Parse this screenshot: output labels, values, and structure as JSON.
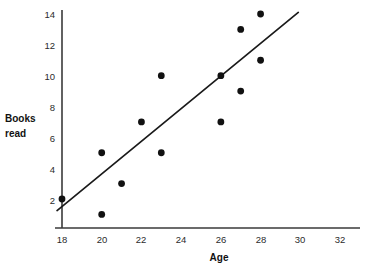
{
  "chart_data": {
    "type": "scatter",
    "title": "",
    "xlabel": "Age",
    "ylabel": "Books read",
    "xlim": [
      17,
      33
    ],
    "ylim": [
      0,
      14.6
    ],
    "grid": false,
    "legend": null,
    "x_ticks": [
      18,
      20,
      22,
      24,
      26,
      28,
      30,
      32
    ],
    "y_ticks": [
      2,
      4,
      6,
      8,
      10,
      12,
      14
    ],
    "x_tick_labels": [
      "18",
      "20",
      "22",
      "24",
      "26",
      "28",
      "30",
      "32"
    ],
    "y_tick_labels": [
      "2",
      "4",
      "6",
      "8",
      "10",
      "12",
      "14"
    ],
    "points": [
      {
        "x": 18,
        "y": 2
      },
      {
        "x": 20,
        "y": 5
      },
      {
        "x": 20,
        "y": 1
      },
      {
        "x": 21,
        "y": 3
      },
      {
        "x": 22,
        "y": 7
      },
      {
        "x": 23,
        "y": 10
      },
      {
        "x": 23,
        "y": 5
      },
      {
        "x": 26,
        "y": 10
      },
      {
        "x": 26,
        "y": 7
      },
      {
        "x": 27,
        "y": 13
      },
      {
        "x": 27,
        "y": 9
      },
      {
        "x": 28,
        "y": 14
      },
      {
        "x": 28,
        "y": 11
      }
    ],
    "trend_line": {
      "label": "line of best fit",
      "x_start": 17.75,
      "y_start": 1.25,
      "x_end": 29.9,
      "y_end": 14.1
    },
    "colors": {
      "marker": "#111111",
      "trend_line": "#1a1a1a",
      "axis": "#3a3a3a",
      "tick_text": "#2b2b2b",
      "axis_title": "#111111",
      "background": "#ffffff"
    }
  },
  "labels": {
    "y_axis_title_line1": "Books",
    "y_axis_title_line2": "read",
    "x_axis_title": "Age"
  }
}
